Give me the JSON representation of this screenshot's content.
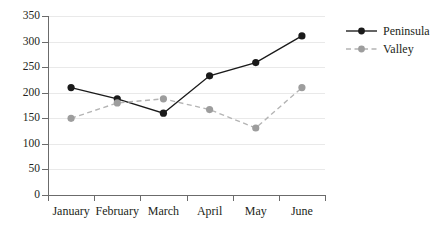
{
  "chart_data": {
    "type": "line",
    "title": "",
    "xlabel": "",
    "ylabel": "",
    "categories": [
      "January",
      "February",
      "March",
      "April",
      "May",
      "June"
    ],
    "ylim": [
      0,
      350
    ],
    "yticks": [
      0,
      50,
      100,
      150,
      200,
      250,
      300,
      350
    ],
    "ytick_labels": [
      "0",
      "50",
      "100",
      "150",
      "200",
      "250",
      "300",
      "350"
    ],
    "grid": "horizontal",
    "legend_position": "upper right outside",
    "series": [
      {
        "name": "Peninsula",
        "values": [
          210,
          188,
          160,
          233,
          259,
          311
        ],
        "color": "#1a1a1a",
        "linestyle": "solid",
        "marker": "circle"
      },
      {
        "name": "Valley",
        "values": [
          150,
          180,
          188,
          167,
          131,
          210
        ],
        "color": "#b4b4b4",
        "linestyle": "dashed",
        "marker": "circle"
      }
    ]
  },
  "legend": {
    "items": [
      {
        "label": "Peninsula"
      },
      {
        "label": "Valley"
      }
    ]
  },
  "caption": {
    "text": ""
  }
}
